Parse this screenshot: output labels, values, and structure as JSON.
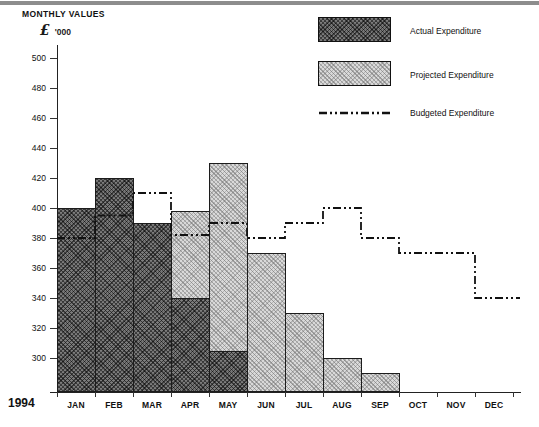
{
  "page": {
    "year_label": "1994"
  },
  "title": {
    "line1": "MONTHLY VALUES",
    "currency_symbol": "£",
    "units_label": "'000"
  },
  "legend": {
    "actual": "Actual Expenditure",
    "projected": "Projected Expenditure",
    "budgeted": "Budgeted Expenditure"
  },
  "colors": {
    "actual_fill": "#6f6f6f",
    "projected_fill": "#d9d9d9",
    "budget_line": "#111111",
    "axis": "#222222"
  },
  "chart_data": {
    "type": "bar",
    "categories": [
      "JAN",
      "FEB",
      "MAR",
      "APR",
      "MAY",
      "JUN",
      "JUL",
      "AUG",
      "SEP",
      "OCT",
      "NOV",
      "DEC"
    ],
    "y_axis": {
      "label": "£ '000",
      "ticks": [
        500,
        480,
        460,
        440,
        420,
        400,
        380,
        360,
        340,
        320,
        300
      ]
    },
    "series": [
      {
        "name": "Actual Expenditure",
        "type": "bar",
        "style": "dark-crosshatch",
        "values": [
          400,
          420,
          390,
          340,
          305,
          null,
          null,
          null,
          null,
          null,
          null,
          null
        ]
      },
      {
        "name": "Projected Expenditure",
        "type": "bar",
        "style": "light-dotted",
        "values": [
          null,
          null,
          null,
          398,
          430,
          370,
          330,
          300,
          290,
          null,
          null,
          null
        ]
      },
      {
        "name": "Budgeted Expenditure",
        "type": "step_line",
        "style": "dash-dot",
        "values": [
          380,
          395,
          410,
          382,
          390,
          380,
          390,
          400,
          380,
          370,
          370,
          340
        ]
      }
    ],
    "x_label_year": "1994",
    "grid": false,
    "legend_position": "top-right"
  }
}
